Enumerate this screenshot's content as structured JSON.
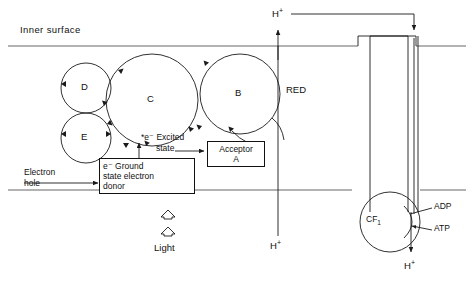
{
  "figure": {
    "membrane": {
      "inner_surface_label": "Inner surface",
      "top_line_y": 46,
      "bottom_line_y": 190
    },
    "carriers": [
      {
        "id": "D",
        "label": "D",
        "cx": 86,
        "cy": 88,
        "r": 25
      },
      {
        "id": "E",
        "label": "E",
        "cx": 86,
        "cy": 138,
        "r": 25
      },
      {
        "id": "C",
        "label": "C",
        "cx": 152,
        "cy": 100,
        "r": 46
      },
      {
        "id": "B",
        "label": "B",
        "cx": 240,
        "cy": 94,
        "r": 40
      }
    ],
    "labels": {
      "red": "RED",
      "excited_state": "*e⁻ Excited state",
      "excited_state_line1": "*e⁻ Excited",
      "excited_state_line2": "state",
      "ground_state": "e⁻ Ground state electron donor",
      "ground_state_line1": "e⁻ Ground",
      "ground_state_line2": "state electron",
      "ground_state_line3": "donor",
      "acceptor_line1": "Acceptor",
      "acceptor_line2": "A",
      "electron_hole_line1": "Electron",
      "electron_hole_line2": "hole",
      "light": "Light",
      "cf1": "CF",
      "cf1_sub": "1",
      "adp": "ADP",
      "atp": "ATP",
      "proton_top": "H",
      "proton_top_sup": "+",
      "proton_mid": "H",
      "proton_mid_sup": "+",
      "proton_bottom": "H",
      "proton_bottom_sup": "+"
    },
    "colors": {
      "stroke": "#1a1a1a",
      "membrane": "#555555",
      "background": "#ffffff",
      "text": "#111111"
    }
  }
}
